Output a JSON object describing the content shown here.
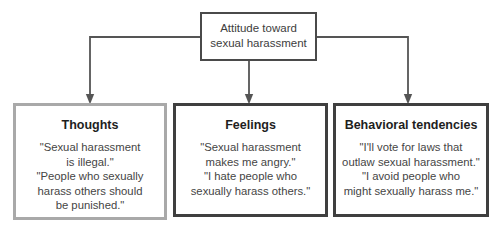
{
  "diagram": {
    "root": {
      "label_line1": "Attitude toward",
      "label_line2": "sexual harassment"
    },
    "components": [
      {
        "title": "Thoughts",
        "lines": [
          "\"Sexual harassment",
          "is illegal.\"",
          "\"People who sexually",
          "harass others should",
          "be punished.\""
        ]
      },
      {
        "title": "Feelings",
        "lines": [
          "\"Sexual harassment",
          "makes me angry.\"",
          "\"I hate people who",
          "sexually harass others.\""
        ]
      },
      {
        "title": "Behavioral tendencies",
        "lines": [
          "\"I'll vote for laws that",
          "outlaw sexual harassment.\"",
          "\"I avoid people who",
          "might sexually harass me.\""
        ]
      }
    ],
    "colors": {
      "root_border": "#4a4a4a",
      "thoughts_border": "#a9a9a9",
      "feelings_border": "#3f3f3f",
      "behavior_border": "#3f3f3f",
      "connector": "#555555"
    }
  }
}
